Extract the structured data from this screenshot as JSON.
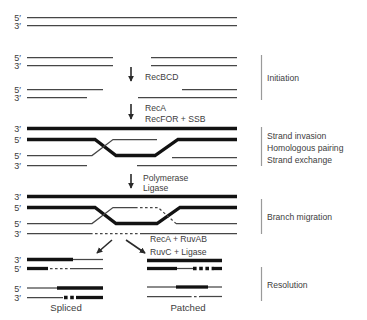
{
  "colors": {
    "background": "#ffffff",
    "thick_strand": "#121212",
    "thin_strand": "#464646",
    "bracket": "#9a9a9a",
    "text": "#3d3d3d"
  },
  "strand_labels": {
    "five_prime": "5′",
    "three_prime": "3′"
  },
  "arrows": {
    "recbcd": "RecBCD",
    "reca": "RecA",
    "recfor_ssb": "RecFOR + SSB",
    "polymerase": "Polymerase",
    "ligase": "Ligase",
    "reca_ruvab": "RecA + RuvAB",
    "ruvc_ligase": "RuvC + Ligase"
  },
  "stages": {
    "initiation": "Initiation",
    "strand_invasion": "Strand invasion",
    "homologous_pairing": "Homologous pairing",
    "strand_exchange": "Strand exchange",
    "branch_migration": "Branch migration",
    "resolution": "Resolution"
  },
  "products": {
    "spliced": "Spliced",
    "patched": "Patched"
  }
}
